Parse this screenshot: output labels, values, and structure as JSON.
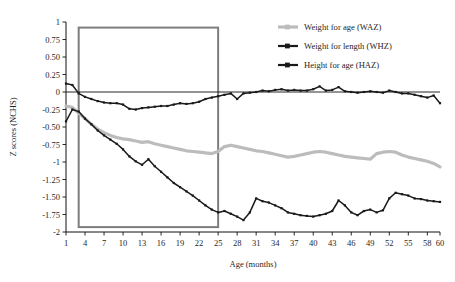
{
  "chart_data": {
    "type": "line",
    "title": "",
    "xlabel": "Age (months)",
    "ylabel": "Z scores (NCHS)",
    "xlim": [
      1,
      60
    ],
    "ylim": [
      -2,
      1
    ],
    "grid": false,
    "legend_position": "top-right",
    "x_tick_labels": [
      "1",
      "4",
      "7",
      "10",
      "13",
      "16",
      "19",
      "22",
      "25",
      "28",
      "31",
      "34",
      "37",
      "40",
      "43",
      "46",
      "49",
      "52",
      "55",
      "58",
      "60"
    ],
    "x_tick_values": [
      1,
      4,
      7,
      10,
      13,
      16,
      19,
      22,
      25,
      28,
      31,
      34,
      37,
      40,
      43,
      46,
      49,
      52,
      55,
      58,
      60
    ],
    "y_tick_labels": [
      "1",
      "0.75",
      "0.50",
      "0.25",
      "0",
      "-0.25",
      "-0.50",
      "-0.75",
      "-1",
      "-1.25",
      "-1.50",
      "-1.75",
      "-2"
    ],
    "y_tick_values": [
      1,
      0.75,
      0.5,
      0.25,
      0,
      -0.25,
      -0.5,
      -0.75,
      -1,
      -1.25,
      -1.5,
      -1.75,
      -2
    ],
    "zero_reference_line": 0,
    "annotations": [
      {
        "name": "highlight-box",
        "x_range": [
          3,
          25
        ],
        "y_range": [
          -1.93,
          0.92
        ],
        "stroke": "#7d7d7d"
      }
    ],
    "x": [
      1,
      2,
      3,
      4,
      5,
      6,
      7,
      8,
      9,
      10,
      11,
      12,
      13,
      14,
      15,
      16,
      17,
      18,
      19,
      20,
      21,
      22,
      23,
      24,
      25,
      26,
      27,
      28,
      29,
      30,
      31,
      32,
      33,
      34,
      35,
      36,
      37,
      38,
      39,
      40,
      41,
      42,
      43,
      44,
      45,
      46,
      47,
      48,
      49,
      50,
      51,
      52,
      53,
      54,
      55,
      56,
      57,
      58,
      59,
      60
    ],
    "series": [
      {
        "name": "Weight for age (WAZ)",
        "color": "#bcbcbc",
        "marker": "square",
        "values": [
          -0.2,
          -0.22,
          -0.3,
          -0.38,
          -0.46,
          -0.53,
          -0.58,
          -0.62,
          -0.65,
          -0.67,
          -0.68,
          -0.7,
          -0.72,
          -0.71,
          -0.74,
          -0.76,
          -0.78,
          -0.8,
          -0.82,
          -0.84,
          -0.85,
          -0.86,
          -0.87,
          -0.88,
          -0.85,
          -0.78,
          -0.76,
          -0.78,
          -0.8,
          -0.82,
          -0.84,
          -0.85,
          -0.87,
          -0.89,
          -0.91,
          -0.93,
          -0.92,
          -0.9,
          -0.88,
          -0.86,
          -0.85,
          -0.86,
          -0.88,
          -0.9,
          -0.92,
          -0.93,
          -0.94,
          -0.95,
          -0.96,
          -0.88,
          -0.86,
          -0.85,
          -0.86,
          -0.9,
          -0.93,
          -0.95,
          -0.97,
          -0.99,
          -1.02,
          -1.07
        ]
      },
      {
        "name": "Weight for length (WHZ)",
        "color": "#1a1a1a",
        "marker": "square",
        "values": [
          -0.42,
          -0.25,
          -0.28,
          -0.38,
          -0.46,
          -0.55,
          -0.62,
          -0.68,
          -0.74,
          -0.82,
          -0.92,
          -0.99,
          -1.04,
          -0.96,
          -1.06,
          -1.14,
          -1.22,
          -1.3,
          -1.36,
          -1.42,
          -1.48,
          -1.55,
          -1.62,
          -1.68,
          -1.72,
          -1.7,
          -1.74,
          -1.78,
          -1.83,
          -1.72,
          -1.52,
          -1.56,
          -1.58,
          -1.62,
          -1.66,
          -1.72,
          -1.74,
          -1.76,
          -1.77,
          -1.78,
          -1.76,
          -1.74,
          -1.7,
          -1.55,
          -1.62,
          -1.72,
          -1.76,
          -1.7,
          -1.68,
          -1.72,
          -1.69,
          -1.52,
          -1.44,
          -1.46,
          -1.48,
          -1.52,
          -1.53,
          -1.55,
          -1.56,
          -1.57
        ]
      },
      {
        "name": "Height for age (HAZ)",
        "color": "#1a1a1a",
        "marker": "square",
        "values": [
          0.12,
          0.1,
          -0.02,
          -0.07,
          -0.1,
          -0.13,
          -0.15,
          -0.16,
          -0.16,
          -0.18,
          -0.24,
          -0.25,
          -0.23,
          -0.22,
          -0.21,
          -0.2,
          -0.2,
          -0.18,
          -0.16,
          -0.17,
          -0.16,
          -0.14,
          -0.1,
          -0.08,
          -0.06,
          -0.04,
          -0.02,
          -0.1,
          -0.02,
          -0.01,
          0.0,
          0.02,
          0.01,
          0.03,
          0.04,
          0.02,
          0.03,
          0.02,
          0.02,
          0.04,
          0.08,
          0.02,
          0.03,
          0.07,
          0.01,
          0.0,
          -0.01,
          0.0,
          0.01,
          0.0,
          -0.01,
          0.02,
          0.0,
          -0.02,
          -0.02,
          -0.04,
          -0.06,
          -0.08,
          -0.05,
          -0.16
        ]
      }
    ]
  },
  "legend": {
    "entries": [
      {
        "label": "Weight for age (WAZ)",
        "color": "#bcbcbc"
      },
      {
        "label": "Weight for length (WHZ)",
        "color": "#1a1a1a"
      },
      {
        "label": "Height for age (HAZ)",
        "color": "#1a1a1a"
      }
    ]
  },
  "axes": {
    "x_title": "Age (months)",
    "y_title": "Z scores (NCHS)"
  }
}
